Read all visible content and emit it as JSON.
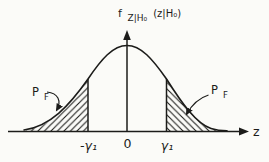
{
  "figure": {
    "pdf_label": {
      "function": "f",
      "subscript": "Z|H₀",
      "argument": "(z|H₀)"
    },
    "regions": {
      "left": {
        "label": "P",
        "label_sub": "F"
      },
      "right": {
        "label": "P",
        "label_sub": "F"
      }
    },
    "axis": {
      "x_label": "z",
      "ticks": {
        "neg_threshold": "-γ₁",
        "origin": "0",
        "pos_threshold": "γ₁"
      }
    },
    "colors": {
      "ink": "#1c1c1a",
      "paper": "#fbfbf8"
    }
  }
}
